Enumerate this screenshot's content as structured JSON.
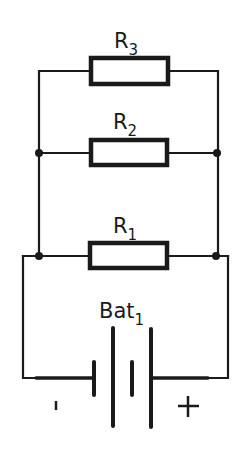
{
  "diagram": {
    "type": "electrical-circuit",
    "colors": {
      "line": "#1a1a1a",
      "background": "#ffffff"
    },
    "components": {
      "r3": {
        "label": "R",
        "subscript": "3"
      },
      "r2": {
        "label": "R",
        "subscript": "2"
      },
      "r1": {
        "label": "R",
        "subscript": "1"
      },
      "battery": {
        "label": "Bat",
        "subscript": "1",
        "negative_sign": "-",
        "positive_sign": "+"
      }
    }
  }
}
